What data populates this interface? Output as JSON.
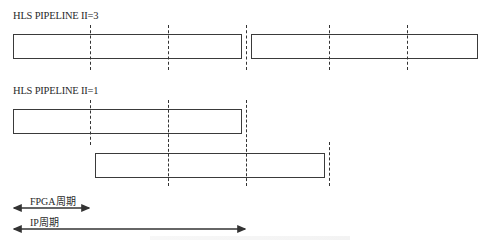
{
  "diagram": {
    "sections": [
      {
        "title": "HLS PIPELINE II=3",
        "boxes": [
          {
            "x": 13,
            "y": 34,
            "w": 229,
            "h": 25
          },
          {
            "x": 251,
            "y": 34,
            "w": 227,
            "h": 25
          }
        ],
        "dashed_lines": [
          {
            "x": 90,
            "y1": 25,
            "y2": 70
          },
          {
            "x": 168,
            "y1": 25,
            "y2": 70
          },
          {
            "x": 246,
            "y1": 25,
            "y2": 70
          },
          {
            "x": 329,
            "y1": 25,
            "y2": 70
          },
          {
            "x": 407,
            "y1": 25,
            "y2": 70
          }
        ]
      },
      {
        "title": "HLS PIPELINE II=1",
        "boxes": [
          {
            "x": 13,
            "y": 109,
            "w": 229,
            "h": 25
          },
          {
            "x": 95,
            "y": 153,
            "w": 230,
            "h": 25
          }
        ],
        "dashed_lines": [
          {
            "x": 90,
            "y1": 100,
            "y2": 145
          },
          {
            "x": 168,
            "y1": 100,
            "y2": 186
          },
          {
            "x": 246,
            "y1": 100,
            "y2": 186
          },
          {
            "x": 329,
            "y1": 142,
            "y2": 186
          }
        ]
      }
    ],
    "legend": [
      {
        "label": "FPGA周期",
        "x1": 13,
        "x2": 90,
        "y": 208,
        "label_x": 30,
        "label_y": 193
      },
      {
        "label": "IP周期",
        "x1": 13,
        "x2": 246,
        "y": 229,
        "label_x": 30,
        "label_y": 214
      }
    ],
    "colors": {
      "stroke": "#3a3a3a",
      "text": "#2a2a2a",
      "background": "#ffffff"
    }
  }
}
